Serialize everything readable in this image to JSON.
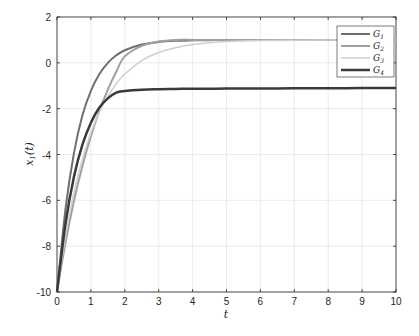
{
  "chart_data": {
    "type": "line",
    "title": "",
    "xlabel": "t",
    "ylabel": "x1(t)",
    "xlim": [
      0,
      10
    ],
    "ylim": [
      -10,
      2
    ],
    "xticks": [
      0,
      1,
      2,
      3,
      4,
      5,
      6,
      7,
      8,
      9,
      10
    ],
    "yticks": [
      -10,
      -8,
      -6,
      -4,
      -2,
      0,
      2
    ],
    "grid": true,
    "legend_position": "upper right",
    "x": [
      0,
      0.25,
      0.5,
      0.75,
      1,
      1.25,
      1.5,
      1.75,
      2,
      2.5,
      3,
      3.5,
      4,
      4.5,
      5,
      6,
      7,
      8,
      9,
      10
    ],
    "series": [
      {
        "name": "G1",
        "color": "#6e6e6e",
        "width": 2,
        "values": [
          -10,
          -6.38,
          -3.94,
          -2.29,
          -1.22,
          -0.49,
          0.0,
          0.33,
          0.55,
          0.8,
          0.91,
          0.96,
          0.98,
          0.99,
          1.0,
          1.0,
          1.0,
          1.0,
          1.0,
          1.0
        ]
      },
      {
        "name": "G2",
        "color": "#a0a0a0",
        "width": 2,
        "values": [
          -10,
          -7.85,
          -6.03,
          -4.5,
          -3.2,
          -2.1,
          -1.17,
          -0.38,
          0.28,
          0.74,
          0.93,
          1.0,
          1.0,
          1.0,
          1.0,
          1.0,
          1.0,
          1.0,
          1.0,
          1.0
        ]
      },
      {
        "name": "G3",
        "color": "#cfcfcf",
        "width": 1.5,
        "values": [
          -10,
          -7.57,
          -5.67,
          -4.2,
          -3.05,
          -2.15,
          -1.45,
          -0.91,
          -0.49,
          0.1,
          0.45,
          0.66,
          0.8,
          0.88,
          0.93,
          0.97,
          0.99,
          1.0,
          1.0,
          1.0
        ]
      },
      {
        "name": "G4",
        "color": "#3a3a3a",
        "width": 2.5,
        "values": [
          -10,
          -7.02,
          -4.97,
          -3.57,
          -2.61,
          -1.95,
          -1.55,
          -1.3,
          -1.23,
          -1.17,
          -1.15,
          -1.14,
          -1.13,
          -1.13,
          -1.12,
          -1.12,
          -1.11,
          -1.11,
          -1.1,
          -1.1
        ]
      }
    ]
  },
  "legend": {
    "items": [
      "G1",
      "G2",
      "G3",
      "G4"
    ]
  }
}
